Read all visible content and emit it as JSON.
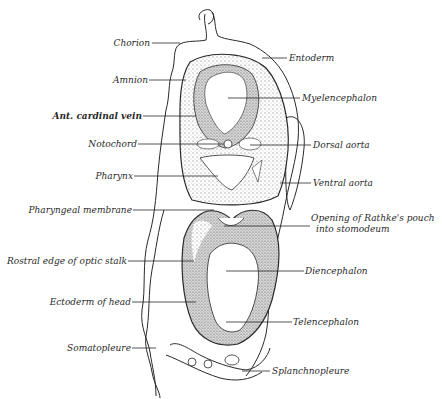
{
  "diagram": {
    "type": "anatomical-cross-section",
    "colors": {
      "ink": "#2a2a2a",
      "stipple": "#8a8a8a",
      "background": "#ffffff"
    },
    "labels_left": [
      {
        "id": "chorion",
        "text": "Chorion"
      },
      {
        "id": "amnion",
        "text": "Amnion"
      },
      {
        "id": "ant-cardinal-vein",
        "text": "Ant. cardinal vein"
      },
      {
        "id": "notochord",
        "text": "Notochord"
      },
      {
        "id": "pharynx",
        "text": "Pharynx"
      },
      {
        "id": "pharyngeal-membrane",
        "text": "Pharyngeal membrane"
      },
      {
        "id": "rostral-edge-optic-stalk",
        "text": "Rostral edge of optic stalk"
      },
      {
        "id": "ectoderm-of-head",
        "text": "Ectoderm of head"
      },
      {
        "id": "somatopleure",
        "text": "Somatopleure"
      }
    ],
    "labels_right": [
      {
        "id": "entoderm",
        "text": "Entoderm"
      },
      {
        "id": "myelencephalon",
        "text": "Myelencephalon"
      },
      {
        "id": "dorsal-aorta",
        "text": "Dorsal aorta"
      },
      {
        "id": "ventral-aorta",
        "text": "Ventral aorta"
      },
      {
        "id": "rathkes-pouch-line1",
        "text": "Opening of Rathke's pouch"
      },
      {
        "id": "rathkes-pouch-line2",
        "text": "into stomodeum"
      },
      {
        "id": "diencephalon",
        "text": "Diencephalon"
      },
      {
        "id": "telencephalon",
        "text": "Telencephalon"
      },
      {
        "id": "splanchnopleure",
        "text": "Splanchnopleure"
      }
    ]
  }
}
